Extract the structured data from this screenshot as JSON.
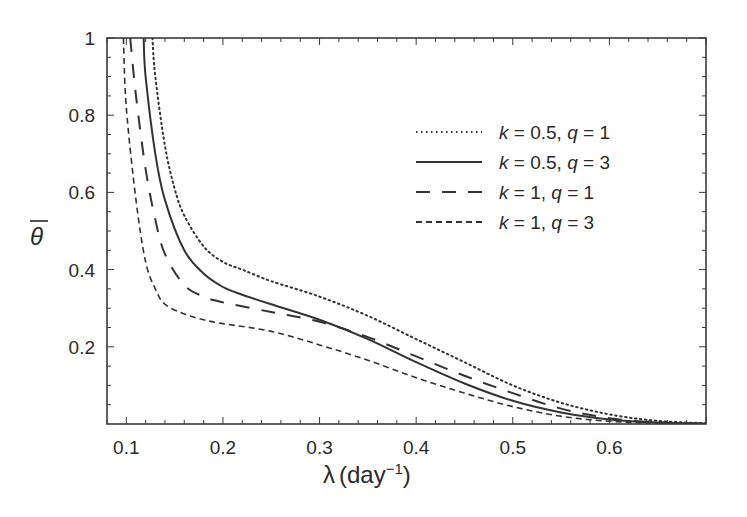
{
  "chart_data": {
    "type": "line",
    "title": "",
    "xlabel": "λ (day⁻¹)",
    "xlabel_symbol": "λ",
    "xlabel_unit": "(day",
    "xlabel_exp": "−1",
    "ylabel": "θ̄",
    "xlim": [
      0.08,
      0.7
    ],
    "ylim": [
      0,
      1
    ],
    "xticks": [
      0.1,
      0.2,
      0.3,
      0.4,
      0.5,
      0.6
    ],
    "xtick_labels": [
      "0.1",
      "0.2",
      "0.3",
      "0.4",
      "0.5",
      "0.6"
    ],
    "yticks": [
      0.2,
      0.4,
      0.6,
      0.8,
      1
    ],
    "ytick_labels": [
      "0.2",
      "0.4",
      "0.6",
      "0.8",
      "1"
    ],
    "grid": false,
    "legend_position": "upper right",
    "series": [
      {
        "name": "k = 0.5, q = 1",
        "k": "0.5",
        "q": "1",
        "style": "dotted",
        "x": [
          0.127,
          0.13,
          0.14,
          0.15,
          0.16,
          0.18,
          0.2,
          0.22,
          0.25,
          0.3,
          0.35,
          0.4,
          0.45,
          0.5,
          0.55,
          0.6,
          0.65,
          0.7
        ],
        "y": [
          1.0,
          0.9,
          0.72,
          0.61,
          0.54,
          0.46,
          0.42,
          0.4,
          0.37,
          0.33,
          0.28,
          0.22,
          0.16,
          0.1,
          0.055,
          0.025,
          0.008,
          0.002
        ]
      },
      {
        "name": "k = 0.5, q = 3",
        "k": "0.5",
        "q": "3",
        "style": "solid",
        "x": [
          0.118,
          0.12,
          0.13,
          0.14,
          0.16,
          0.18,
          0.2,
          0.22,
          0.25,
          0.3,
          0.35,
          0.4,
          0.45,
          0.5,
          0.55,
          0.6,
          0.65,
          0.7
        ],
        "y": [
          1.0,
          0.9,
          0.7,
          0.58,
          0.45,
          0.39,
          0.355,
          0.335,
          0.31,
          0.27,
          0.22,
          0.16,
          0.105,
          0.06,
          0.03,
          0.012,
          0.004,
          0.001
        ]
      },
      {
        "name": "k = 1, q = 1",
        "k": "1",
        "q": "1",
        "style": "long-dash",
        "x": [
          0.104,
          0.11,
          0.12,
          0.13,
          0.14,
          0.16,
          0.18,
          0.2,
          0.25,
          0.3,
          0.35,
          0.4,
          0.45,
          0.5,
          0.55,
          0.6,
          0.65,
          0.7
        ],
        "y": [
          1.0,
          0.85,
          0.66,
          0.53,
          0.44,
          0.36,
          0.33,
          0.315,
          0.29,
          0.265,
          0.225,
          0.175,
          0.125,
          0.08,
          0.04,
          0.015,
          0.004,
          0.001
        ]
      },
      {
        "name": "k = 1, q = 3",
        "k": "1",
        "q": "3",
        "style": "short-dash",
        "x": [
          0.097,
          0.1,
          0.11,
          0.12,
          0.13,
          0.14,
          0.16,
          0.18,
          0.2,
          0.25,
          0.3,
          0.35,
          0.4,
          0.45,
          0.5,
          0.55,
          0.6,
          0.65,
          0.7
        ],
        "y": [
          1.0,
          0.82,
          0.58,
          0.42,
          0.35,
          0.31,
          0.285,
          0.27,
          0.26,
          0.24,
          0.205,
          0.165,
          0.12,
          0.08,
          0.045,
          0.02,
          0.007,
          0.002,
          0.0005
        ]
      }
    ]
  }
}
